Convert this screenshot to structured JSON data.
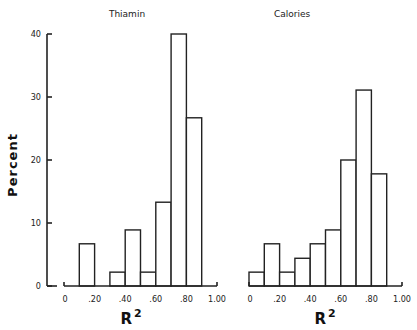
{
  "figure": {
    "ylabel": "Percent",
    "xlabel": "R",
    "xlabel_sup": "2"
  },
  "chart_data": [
    {
      "type": "bar",
      "title": "Thiamin",
      "xlabel": "R²",
      "ylabel": "Percent",
      "ylim": [
        0,
        40
      ],
      "xlim": [
        0,
        1.0
      ],
      "xticks": [
        "0",
        ".20",
        ".40",
        ".60",
        ".80",
        "1.00"
      ],
      "yticks": [
        "0",
        "10",
        "20",
        "30",
        "40"
      ],
      "bin_width": 0.1,
      "bins": [
        [
          0.0,
          0.1
        ],
        [
          0.1,
          0.2
        ],
        [
          0.2,
          0.3
        ],
        [
          0.3,
          0.4
        ],
        [
          0.4,
          0.5
        ],
        [
          0.5,
          0.6
        ],
        [
          0.6,
          0.7
        ],
        [
          0.7,
          0.8
        ],
        [
          0.8,
          0.9
        ]
      ],
      "values": [
        0,
        6.7,
        0,
        2.2,
        8.9,
        2.2,
        13.3,
        40.0,
        26.7
      ],
      "grid": false
    },
    {
      "type": "bar",
      "title": "Calories",
      "xlabel": "R²",
      "ylabel": "Percent",
      "ylim": [
        0,
        40
      ],
      "xlim": [
        0,
        1.0
      ],
      "xticks": [
        "0",
        ".20",
        ".40",
        ".60",
        ".80",
        "1.00"
      ],
      "bin_width": 0.1,
      "bins": [
        [
          0.0,
          0.1
        ],
        [
          0.1,
          0.2
        ],
        [
          0.2,
          0.3
        ],
        [
          0.3,
          0.4
        ],
        [
          0.4,
          0.5
        ],
        [
          0.5,
          0.6
        ],
        [
          0.6,
          0.7
        ],
        [
          0.7,
          0.8
        ],
        [
          0.8,
          0.9
        ]
      ],
      "values": [
        2.2,
        6.7,
        2.2,
        4.4,
        6.7,
        8.9,
        20.0,
        31.1,
        17.8
      ],
      "grid": false
    }
  ]
}
